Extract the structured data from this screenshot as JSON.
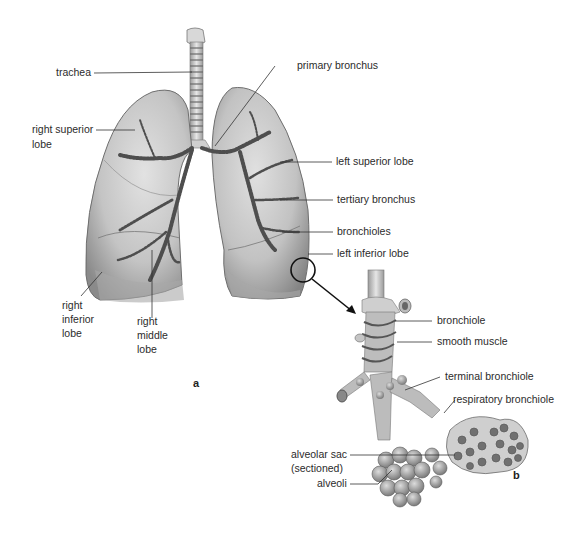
{
  "figure": {
    "panel_a": {
      "id": "a",
      "labels": {
        "trachea": "trachea",
        "primary_bronchus": "primary bronchus",
        "right_superior_lobe_1": "right superior",
        "right_superior_lobe_2": "lobe",
        "left_superior_lobe": "left superior lobe",
        "tertiary_bronchus": "tertiary bronchus",
        "bronchioles": "bronchioles",
        "left_inferior_lobe": "left inferior lobe",
        "right_inferior_lobe_1": "right",
        "right_inferior_lobe_2": "inferior",
        "right_inferior_lobe_3": "lobe",
        "right_middle_lobe_1": "right",
        "right_middle_lobe_2": "middle",
        "right_middle_lobe_3": "lobe"
      }
    },
    "panel_b": {
      "id": "b",
      "labels": {
        "bronchiole": "bronchiole",
        "smooth_muscle": "smooth muscle",
        "terminal_bronchiole": "terminal bronchiole",
        "respiratory_bronchiole": "respiratory bronchiole",
        "alveolar_sac_1": "alveolar sac",
        "alveolar_sac_2": "(sectioned)",
        "alveoli": "alveoli"
      }
    },
    "colors": {
      "lung_fill": "#c9c9c9",
      "lung_shadow": "#8e8e8e",
      "bronchi": "#555555",
      "leader_line": "#333333",
      "text": "#2b2b2b"
    }
  }
}
